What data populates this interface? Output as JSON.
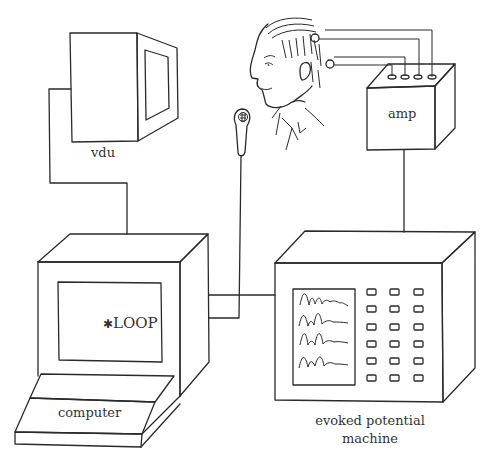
{
  "diagram": {
    "labels": {
      "vdu": "vdu",
      "amp": "amp",
      "computer": "computer",
      "screen_text": "LOOP",
      "screen_marker": "✱",
      "evoked_line1": "evoked potential",
      "evoked_line2": "machine"
    },
    "components": [
      {
        "id": "vdu",
        "label": "vdu"
      },
      {
        "id": "subject-head",
        "label": ""
      },
      {
        "id": "microphone",
        "label": ""
      },
      {
        "id": "amp",
        "label": "amp"
      },
      {
        "id": "computer",
        "label": "computer"
      },
      {
        "id": "evoked-potential-machine",
        "label": "evoked potential machine"
      }
    ],
    "connections": [
      [
        "vdu",
        "computer"
      ],
      [
        "microphone",
        "computer"
      ],
      [
        "subject-head",
        "amp"
      ],
      [
        "amp",
        "evoked-potential-machine"
      ],
      [
        "computer",
        "evoked-potential-machine"
      ]
    ],
    "evoked_buttons": {
      "rows": 6,
      "cols": 3
    },
    "waveforms": 4,
    "colors": {
      "line": "#2a2a2a",
      "background": "#ffffff"
    }
  }
}
